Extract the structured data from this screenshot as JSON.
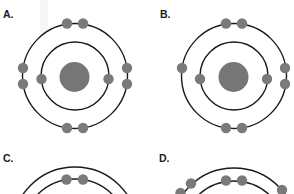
{
  "colors": {
    "background": "#ffffff",
    "shell": "#1a1a1a",
    "nucleus": "#767676",
    "electron": "#7a7a7a"
  },
  "electron_radius": 5.2,
  "panels": [
    {
      "id": "A",
      "label": "A.",
      "label_pos": [
        3,
        18
      ],
      "nucleus": {
        "cx": 74.5,
        "cy": 77,
        "r": 15
      },
      "shells": [
        {
          "cx": 75,
          "cy": 76,
          "r": 34
        },
        {
          "cx": 75,
          "cy": 76,
          "r": 52.5
        }
      ],
      "electrons": [
        [
          41.5,
          79
        ],
        [
          108.5,
          79
        ],
        [
          67,
          23.5
        ],
        [
          83,
          23.5
        ],
        [
          23,
          68
        ],
        [
          23,
          84
        ],
        [
          127,
          68
        ],
        [
          127,
          84
        ],
        [
          67,
          128
        ],
        [
          83,
          128
        ]
      ]
    },
    {
      "id": "B",
      "label": "B.",
      "label_pos": [
        160,
        18
      ],
      "nucleus": {
        "cx": 233.5,
        "cy": 77,
        "r": 15
      },
      "shells": [
        {
          "cx": 234,
          "cy": 76,
          "r": 34
        },
        {
          "cx": 234,
          "cy": 76,
          "r": 52.5
        }
      ],
      "electrons": [
        [
          200,
          79
        ],
        [
          267,
          79
        ],
        [
          226,
          23.5
        ],
        [
          242,
          23.5
        ],
        [
          182,
          68
        ],
        [
          285,
          68
        ],
        [
          285,
          84
        ],
        [
          226,
          128
        ],
        [
          242,
          128
        ]
      ]
    },
    {
      "id": "C",
      "label": "C.",
      "label_pos": [
        3,
        162
      ],
      "nucleus": null,
      "shells": [
        {
          "cx": 75,
          "cy": 232,
          "r": 53
        },
        {
          "cx": 75,
          "cy": 230,
          "r": 63
        }
      ],
      "electrons": [
        [
          66.5,
          179.5
        ],
        [
          83,
          179.5
        ]
      ]
    },
    {
      "id": "D",
      "label": "D.",
      "label_pos": [
        159,
        162
      ],
      "nucleus": null,
      "shells": [
        {
          "cx": 234,
          "cy": 233,
          "r": 52
        },
        {
          "cx": 234,
          "cy": 231,
          "r": 63
        }
      ],
      "electrons": [
        [
          226,
          180.5
        ],
        [
          242,
          180.5
        ],
        [
          191,
          183.5
        ],
        [
          180.5,
          193
        ],
        [
          282,
          190
        ]
      ]
    }
  ]
}
